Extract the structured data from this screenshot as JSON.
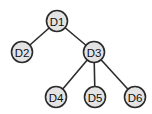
{
  "diagram": {
    "type": "tree",
    "style": {
      "node_fill": "#e3e3e3",
      "node_stroke": "#2b2b2b",
      "edge_color": "#2b2b2b",
      "text_color": "#111111"
    },
    "nodes": [
      {
        "id": "D1",
        "label": "D1",
        "cx": 57,
        "cy": 21,
        "r": 10.5
      },
      {
        "id": "D2",
        "label": "D2",
        "cx": 22,
        "cy": 52,
        "r": 10.5
      },
      {
        "id": "D3",
        "label": "D3",
        "cx": 94,
        "cy": 52,
        "r": 10.5
      },
      {
        "id": "D4",
        "label": "D4",
        "cx": 56,
        "cy": 97,
        "r": 10.5
      },
      {
        "id": "D5",
        "label": "D5",
        "cx": 95,
        "cy": 97,
        "r": 10.5
      },
      {
        "id": "D6",
        "label": "D6",
        "cx": 135,
        "cy": 97,
        "r": 10.5
      }
    ],
    "edges": [
      {
        "from": "D1",
        "to": "D2"
      },
      {
        "from": "D1",
        "to": "D3"
      },
      {
        "from": "D3",
        "to": "D4"
      },
      {
        "from": "D3",
        "to": "D5"
      },
      {
        "from": "D3",
        "to": "D6"
      }
    ]
  }
}
